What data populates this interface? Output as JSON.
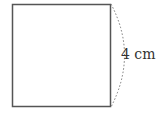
{
  "diagram": {
    "shape": "square",
    "side_label": "4 cm",
    "stroke_color": "#555555"
  }
}
